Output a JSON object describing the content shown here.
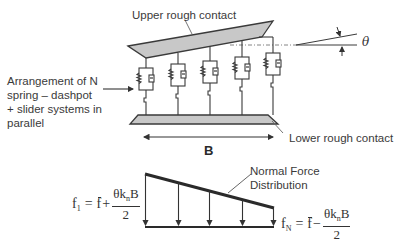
{
  "labels": {
    "upper_contact": "Upper rough contact",
    "lower_contact": "Lower rough contact",
    "arrangement_lines": [
      "Arrangement of N",
      "spring – dashpot",
      "+ slider systems in",
      "parallel"
    ],
    "width_symbol": "B",
    "angle_symbol": "θ",
    "normal_force_lines": [
      "Normal Force",
      "Distribution"
    ]
  },
  "formulas": {
    "first": {
      "lhs": "f",
      "lhs_sub": "1",
      "equals": "=",
      "mean": "f",
      "operator": "+",
      "numerator_theta": "θk",
      "numerator_sub": "n",
      "numerator_b": "B",
      "denominator": "2"
    },
    "last": {
      "lhs": "f",
      "lhs_sub": "N",
      "equals": "=",
      "mean": "f",
      "operator": "−",
      "numerator_theta": "θk",
      "numerator_sub": "n",
      "numerator_b": "B",
      "denominator": "2"
    }
  },
  "elements": {
    "count": 5,
    "x_positions": [
      146,
      178,
      210,
      242,
      273
    ]
  },
  "colors": {
    "plate_fill": "#c8c8c8",
    "stroke": "#3a3a3a",
    "text": "#3a3a3a"
  }
}
